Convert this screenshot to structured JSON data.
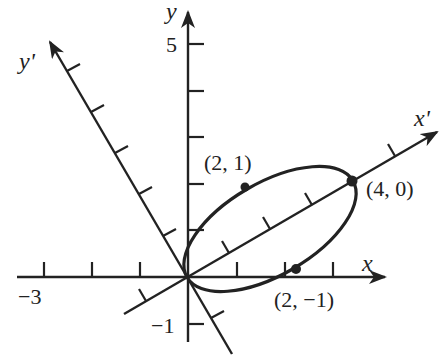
{
  "diagram": {
    "title": "",
    "colors": {
      "ink": "#222222",
      "background": "#ffffff"
    },
    "axes": {
      "x": {
        "label": "x",
        "tick_labels": {
          "neg3": "−3"
        }
      },
      "y": {
        "label": "y",
        "tick_labels": {
          "pos5": "5",
          "neg1": "−1"
        }
      },
      "x_prime": {
        "label": "x'"
      },
      "y_prime": {
        "label": "y'"
      }
    },
    "points": [
      {
        "label": "(2, 1)",
        "system": "x'y'",
        "xp": 2,
        "yp": 1
      },
      {
        "label": "(4, 0)",
        "system": "x'y'",
        "xp": 4,
        "yp": 0
      },
      {
        "label": "(2, −1)",
        "system": "x'y'",
        "xp": 2,
        "yp": -1
      }
    ],
    "ellipse": {
      "center_xp": 2,
      "center_yp": 0,
      "semi_major": 2,
      "semi_minor": 1,
      "rotation_deg": 30
    }
  }
}
